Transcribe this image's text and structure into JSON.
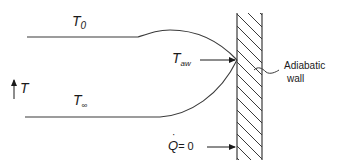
{
  "diagram": {
    "type": "adiabatic wall temperature profile",
    "labels": {
      "t0": {
        "main": "T",
        "sub": "0"
      },
      "taw": {
        "main": "T",
        "sub": "aw"
      },
      "tinf": {
        "main": "T",
        "sub": "∞"
      },
      "t_axis": "T",
      "wall_line1": "Adiabatic",
      "wall_line2": "wall",
      "q_main": "Q",
      "q_eq": "= 0"
    },
    "colors": {
      "stroke": "#3a3a3a",
      "text": "#1a1a1a"
    }
  }
}
